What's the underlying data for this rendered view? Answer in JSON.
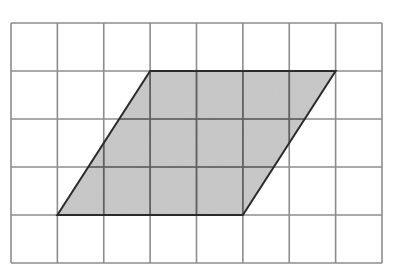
{
  "diagram": {
    "type": "grid-with-shaded-parallelogram",
    "grid": {
      "columns": 8,
      "rows": 5,
      "origin_px": [
        11,
        23
      ],
      "cell_width_px": 46.375,
      "cell_height_px": 48,
      "line_color": "#8c8c8c",
      "line_width": 1.6
    },
    "shape": {
      "kind": "parallelogram",
      "vertices_grid": [
        [
          3,
          1
        ],
        [
          7,
          1
        ],
        [
          5,
          4
        ],
        [
          1,
          4
        ]
      ],
      "fill_color": "#c9c9c9",
      "inner_grid_color": "#5f5f5f",
      "outline_color": "#2b2b2b",
      "outline_width": 2,
      "base_units": 4,
      "height_units": 3
    }
  }
}
